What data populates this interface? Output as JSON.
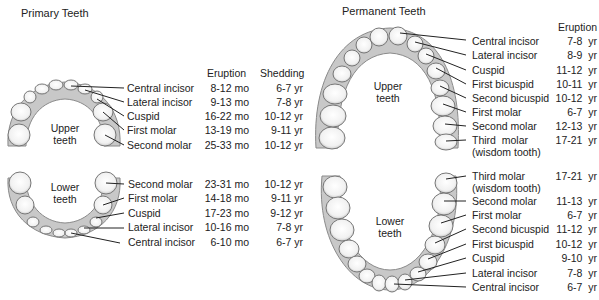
{
  "primary": {
    "title": "Primary Teeth",
    "headers": {
      "eruption": "Eruption",
      "shedding": "Shedding"
    },
    "upper_label": "Upper\nteeth",
    "upper_label_lines": [
      "Upper",
      "teeth"
    ],
    "lower_label_lines": [
      "Lower",
      "teeth"
    ],
    "upper": [
      {
        "tooth": "Central incisor",
        "eruption": "8-12 mo",
        "shedding": "6-7 yr"
      },
      {
        "tooth": "Lateral incisor",
        "eruption": "9-13 mo",
        "shedding": "7-8 yr"
      },
      {
        "tooth": "Cuspid",
        "eruption": "16-22 mo",
        "shedding": "10-12 yr"
      },
      {
        "tooth": "First molar",
        "eruption": "13-19 mo",
        "shedding": "9-11 yr"
      },
      {
        "tooth": "Second molar",
        "eruption": "25-33 mo",
        "shedding": "10-12 yr"
      }
    ],
    "lower": [
      {
        "tooth": "Second molar",
        "eruption": "23-31 mo",
        "shedding": "10-12 yr"
      },
      {
        "tooth": "First molar",
        "eruption": "14-18 mo",
        "shedding": "9-11 yr"
      },
      {
        "tooth": "Cuspid",
        "eruption": "17-23 mo",
        "shedding": "9-12 yr"
      },
      {
        "tooth": "Lateral incisor",
        "eruption": "10-16 mo",
        "shedding": "7-8 yr"
      },
      {
        "tooth": "Central incisor",
        "eruption": "6-10 mo",
        "shedding": "6-7 yr"
      }
    ]
  },
  "permanent": {
    "title": "Permanent Teeth",
    "headers": {
      "eruption": "Eruption"
    },
    "upper_label_lines": [
      "Upper",
      "teeth"
    ],
    "lower_label_lines": [
      "Lower",
      "teeth"
    ],
    "upper": [
      {
        "tooth": "Central incisor",
        "eruption": "7-8  yr"
      },
      {
        "tooth": "Lateral incisor",
        "eruption": "8-9  yr"
      },
      {
        "tooth": "Cuspid",
        "eruption": "11-12  yr"
      },
      {
        "tooth": "First bicuspid",
        "eruption": "10-11  yr"
      },
      {
        "tooth": "Second bicuspid",
        "eruption": "10-12  yr"
      },
      {
        "tooth": "First molar",
        "eruption": "6-7  yr"
      },
      {
        "tooth": "Second molar",
        "eruption": "12-13  yr"
      },
      {
        "tooth": "Third  molar",
        "tooth_line2": "(wisdom tooth)",
        "eruption": "17-21  yr"
      }
    ],
    "lower": [
      {
        "tooth": "Third molar",
        "tooth_line2": "(wisdom tooth)",
        "eruption": "17-21  yr"
      },
      {
        "tooth": "Second molar",
        "eruption": "11-13  yr"
      },
      {
        "tooth": "First molar",
        "eruption": "6-7  yr"
      },
      {
        "tooth": "Second bicuspid",
        "eruption": "11-12  yr"
      },
      {
        "tooth": "First bicuspid",
        "eruption": "10-12  yr"
      },
      {
        "tooth": "Cuspid",
        "eruption": "9-10  yr"
      },
      {
        "tooth": "Lateral incisor",
        "eruption": "7-8  yr"
      },
      {
        "tooth": "Central incisor",
        "eruption": "6-7  yr"
      }
    ]
  }
}
